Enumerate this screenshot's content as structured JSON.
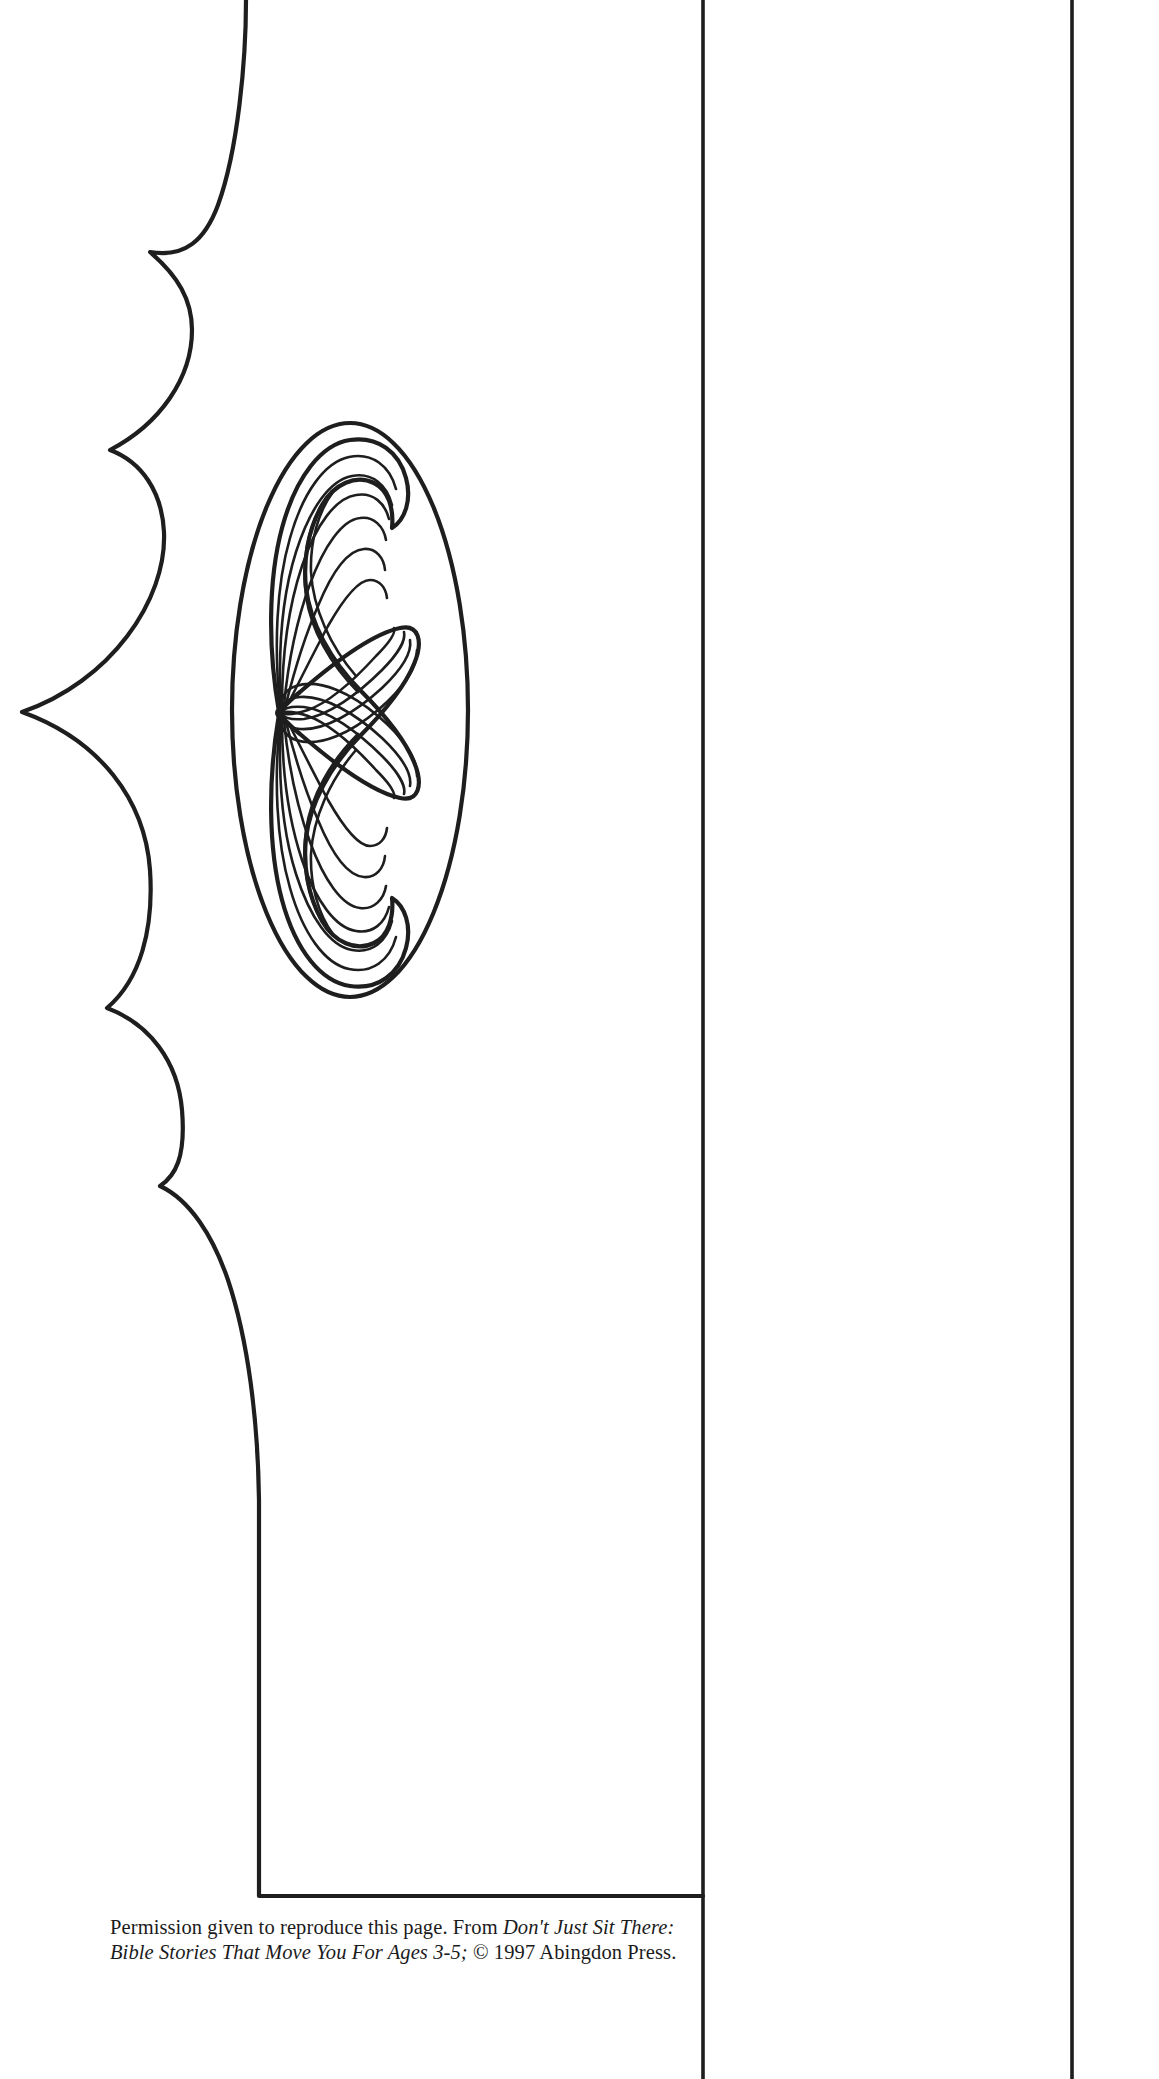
{
  "page": {
    "width": 1159,
    "height": 2079,
    "background_color": "#ffffff",
    "ink_color": "#1e1e1e",
    "type": "printable-craft-template"
  },
  "artwork": {
    "title": "Mustache craft cut-out pattern",
    "elements": [
      {
        "name": "scalloped-shape",
        "description": "Large half-figure outline with five scallop bumps along the left edge, flat vertical right edge and a flat bottom edge"
      },
      {
        "name": "mustache-oval",
        "description": "Tall oval frame enclosing a curled mustache drawing"
      },
      {
        "name": "mustache-drawing",
        "description": "Handlebar mustache with radiating hair strands converging at a central point"
      },
      {
        "name": "fold-line-left",
        "description": "Vertical fold/cut guide line"
      },
      {
        "name": "fold-line-right",
        "description": "Vertical fold/cut guide line"
      }
    ]
  },
  "caption": {
    "line1_plain_a": "Permission given to reproduce this page. From ",
    "line1_italic": "Don't Just Sit There:",
    "line2_italic": "Bible Stories That Move You For Ages 3-5;",
    "line2_plain": " © 1997 Abingdon Press."
  },
  "geometry": {
    "vertical_line_1_x": 703,
    "vertical_line_2_x": 1072,
    "shape_bottom_y": 1896,
    "oval_center_x": 350,
    "oval_center_y": 710,
    "oval_rx": 118,
    "oval_ry": 287
  }
}
